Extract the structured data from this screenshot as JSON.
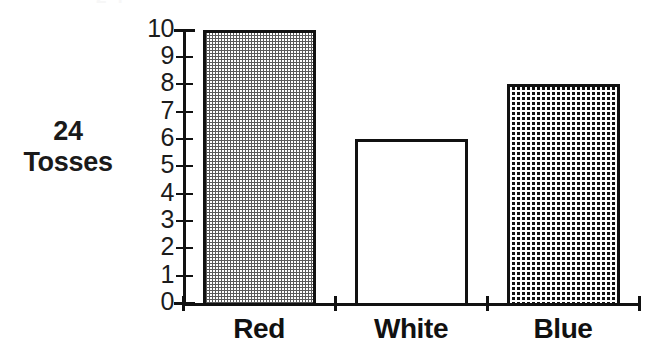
{
  "header": {
    "clipped_fragment": "2 4"
  },
  "caption": {
    "line1": "24",
    "line2": "Tosses"
  },
  "chart_data": {
    "type": "bar",
    "title": "",
    "subtitle": "",
    "xlabel": "",
    "ylabel": "",
    "categories": [
      "Red",
      "White",
      "Blue"
    ],
    "values": [
      10,
      6,
      8
    ],
    "series": [
      {
        "name": "24 Tosses",
        "values": [
          10,
          6,
          8
        ]
      }
    ],
    "bar_fills": [
      "light-checker-dither",
      "white-plain",
      "dark-dense-dither"
    ],
    "bar_outline_color": "#111111",
    "ylim": [
      0,
      10
    ],
    "ytick_values": [
      0,
      1,
      2,
      3,
      4,
      5,
      6,
      7,
      8,
      9,
      10
    ],
    "ytick_labels": [
      "0",
      "1",
      "2",
      "3",
      "4",
      "5",
      "6",
      "7",
      "8",
      "9",
      "10"
    ],
    "grid": false,
    "legend": false,
    "legend_position": "none",
    "annotations": [
      "24 Tosses"
    ],
    "axis_color": "#111111",
    "background_color": "#ffffff"
  }
}
